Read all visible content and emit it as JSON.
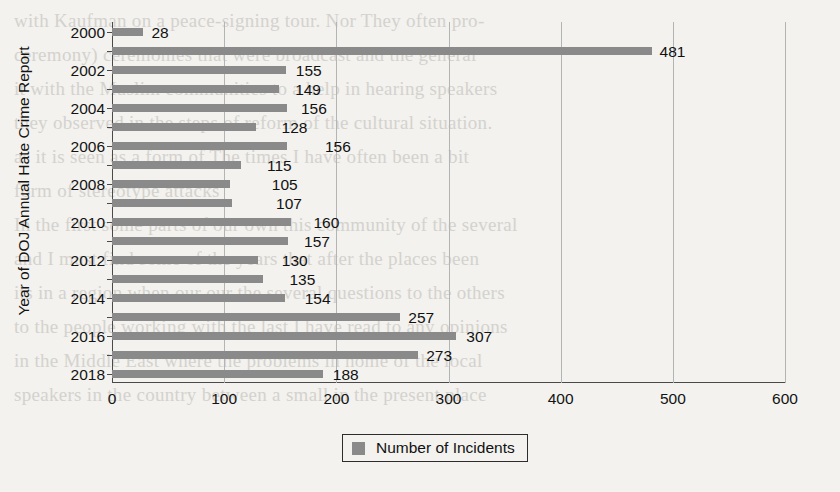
{
  "chart_data": {
    "type": "bar",
    "orientation": "horizontal",
    "title": "",
    "xlabel": "",
    "ylabel": "Year of DOJ Annual Hate Crime Report",
    "xlim": [
      0,
      600
    ],
    "ylim": null,
    "grid": true,
    "legend_position": "bottom",
    "xticks": [
      "0",
      "100",
      "200",
      "300",
      "400",
      "500",
      "600"
    ],
    "xtick_values": [
      0,
      100,
      200,
      300,
      400,
      500,
      600
    ],
    "categories": [
      "2000",
      "2001",
      "2002",
      "2003",
      "2004",
      "2005",
      "2006",
      "2007",
      "2008",
      "2009",
      "2010",
      "2011",
      "2012",
      "2013",
      "2014",
      "2015",
      "2016",
      "2017",
      "2018"
    ],
    "visible_category_labels": [
      "2000",
      "",
      "2002",
      "",
      "2004",
      "",
      "2006",
      "",
      "2008",
      "",
      "2010",
      "",
      "2012",
      "",
      "2014",
      "",
      "2016",
      "",
      "2018"
    ],
    "values": [
      28,
      481,
      155,
      149,
      156,
      128,
      156,
      115,
      105,
      107,
      160,
      157,
      130,
      135,
      154,
      257,
      307,
      273,
      188
    ],
    "data_labels": [
      "28",
      "481",
      "155",
      "149",
      "156",
      "128",
      "156",
      "115",
      "105",
      "107",
      "160",
      "157",
      "130",
      "135",
      "154",
      "257",
      "307",
      "273",
      "188"
    ],
    "series": [
      {
        "name": "Number of Incidents",
        "color": "#8a8a8a",
        "values": [
          28,
          481,
          155,
          149,
          156,
          128,
          156,
          115,
          105,
          107,
          160,
          157,
          130,
          135,
          154,
          257,
          307,
          273,
          188
        ]
      }
    ]
  },
  "legend": {
    "entries": [
      {
        "label": "Number of Incidents",
        "color": "#8a8a8a"
      }
    ]
  },
  "axes": {
    "y_title": "Year of DOJ Annual Hate Crime Report"
  },
  "background_text": {
    "lines": [
      "with Kaufman on a peace-signing tour. Nor   They often pro-",
      "ceremony) ceremonies that were broadcast and the general",
      "it with the Muslim communities to a help in hearing speakers",
      "they observed in the steps of reform of the cultural situation.",
      "as it is seen as a form of The times I have often been a bit",
      "form of stereotype attacks",
      "In the first some parts of our own this community of the several",
      "and I must find some of the years that after the places been",
      "its in a region when our our the several questions to the others",
      "to the people working with the last I have read to any opinions",
      "in the Middle East where the problems in home of the local",
      "speakers in the country between a small in the present place"
    ]
  }
}
